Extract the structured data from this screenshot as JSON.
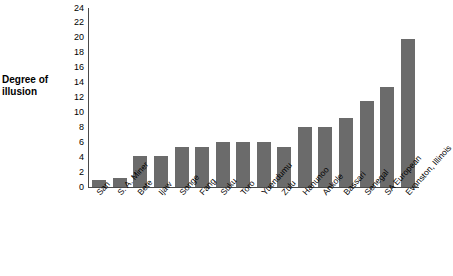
{
  "chart_data": {
    "type": "bar",
    "title": "",
    "subtitle": "",
    "xlabel": "",
    "ylabel": "Degree of illusion",
    "ylabel_lines": [
      "Degree of",
      "illusion"
    ],
    "ylim": [
      0,
      24
    ],
    "ytick_step": 2,
    "yticks": [
      24,
      22,
      20,
      18,
      16,
      14,
      12,
      10,
      8,
      6,
      4,
      2,
      0
    ],
    "ytick_labels": [
      "24",
      "22",
      "20",
      "18",
      "16",
      "14",
      "12",
      "10",
      "8",
      "6",
      "4",
      "2",
      "0"
    ],
    "grid": false,
    "legend": false,
    "legend_position": "none",
    "bar_color": "#6b6b6b",
    "axis_color": "#4a4a4a",
    "background_color": "#ffffff",
    "categories": [
      "San",
      "S. A. Miner",
      "Bete",
      "Ijaw",
      "Songe",
      "Fang",
      "Suku",
      "Toro",
      "Yuendumu",
      "Zulu",
      "Hanunoo",
      "Ankole",
      "Bassari",
      "Senegal",
      "SA European",
      "Evanston, Illinois"
    ],
    "values": [
      1,
      1.2,
      4.2,
      4.2,
      5.4,
      5.4,
      6.1,
      6.1,
      6.1,
      5.4,
      8.1,
      8.1,
      9.2,
      11.5,
      13.4,
      19.8
    ]
  }
}
